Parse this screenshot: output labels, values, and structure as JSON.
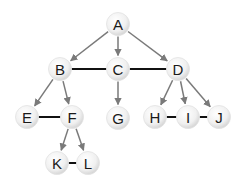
{
  "diagram": {
    "type": "graph",
    "colors": {
      "arrow": "#7a7a7a",
      "undirected_edge": "#111111",
      "node_fill_center": "#ffffff",
      "node_fill_edge": "#dcdcdc",
      "label": "#1a1a1a"
    },
    "nodes": [
      {
        "id": "A",
        "label": "A",
        "x": 118,
        "y": 24
      },
      {
        "id": "B",
        "label": "B",
        "x": 60,
        "y": 69
      },
      {
        "id": "C",
        "label": "C",
        "x": 118,
        "y": 69
      },
      {
        "id": "D",
        "label": "D",
        "x": 178,
        "y": 69
      },
      {
        "id": "E",
        "label": "E",
        "x": 27,
        "y": 117
      },
      {
        "id": "F",
        "label": "F",
        "x": 72,
        "y": 117
      },
      {
        "id": "G",
        "label": "G",
        "x": 118,
        "y": 118
      },
      {
        "id": "H",
        "label": "H",
        "x": 155,
        "y": 117
      },
      {
        "id": "I",
        "label": "I",
        "x": 188,
        "y": 117
      },
      {
        "id": "J",
        "label": "J",
        "x": 219,
        "y": 117
      },
      {
        "id": "K",
        "label": "K",
        "x": 57,
        "y": 163
      },
      {
        "id": "L",
        "label": "L",
        "x": 88,
        "y": 163
      }
    ],
    "directed_edges": [
      {
        "from": "A",
        "to": "B"
      },
      {
        "from": "A",
        "to": "C"
      },
      {
        "from": "A",
        "to": "D"
      },
      {
        "from": "B",
        "to": "E"
      },
      {
        "from": "B",
        "to": "F"
      },
      {
        "from": "C",
        "to": "G"
      },
      {
        "from": "D",
        "to": "H"
      },
      {
        "from": "D",
        "to": "I"
      },
      {
        "from": "D",
        "to": "J"
      },
      {
        "from": "F",
        "to": "K"
      },
      {
        "from": "F",
        "to": "L"
      }
    ],
    "undirected_edges": [
      {
        "from": "B",
        "to": "C"
      },
      {
        "from": "C",
        "to": "D"
      },
      {
        "from": "E",
        "to": "F"
      },
      {
        "from": "H",
        "to": "I"
      },
      {
        "from": "I",
        "to": "J"
      },
      {
        "from": "K",
        "to": "L"
      }
    ]
  }
}
